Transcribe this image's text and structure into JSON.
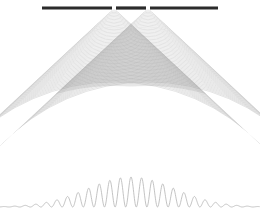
{
  "figure": {
    "background_color": "#ffffff",
    "width": 260,
    "height": 212
  },
  "barrier": {
    "name": "slit-barrier",
    "color": "#2b2b2b",
    "x_start": 42,
    "x_end": 218,
    "y": 8,
    "thickness": 3.2
  },
  "slits": [
    {
      "label": "slit-1",
      "x": 114.0,
      "y": 8,
      "width": 4.0
    },
    {
      "label": "slit-2",
      "x": 148.0,
      "y": 8,
      "width": 4.0
    }
  ],
  "wavefronts": {
    "name": "circular-wavefronts",
    "color": "#9a9a9a",
    "stroke_width": 0.5,
    "wavelength": 3.9,
    "ring_count": 52,
    "half_angle_deg": 47,
    "max_radius": 214,
    "opacity": 0.55
  },
  "overlap_region": {
    "name": "interference-overlap",
    "shading_color": "#bdbdbd",
    "opacity": 0.35
  },
  "intensity_curve": {
    "name": "interference-intensity-curve",
    "color": "#b4b4b4",
    "stroke_width": 0.8,
    "baseline_y": 207,
    "peak_height": 30,
    "center_x": 131,
    "fringe_count": 11,
    "fringe_spacing": 10.6,
    "envelope_width": 62
  },
  "chart_data": {
    "type": "line",
    "xlabel": "",
    "ylabel": "",
    "x": [
      -5,
      -4.5,
      -4,
      -3.5,
      -3,
      -2.5,
      -2,
      -1.5,
      -1,
      -0.5,
      0,
      0.5,
      1,
      1.5,
      2,
      2.5,
      3,
      3.5,
      4,
      4.5,
      5
    ],
    "values": [
      0.04,
      0.0,
      0.11,
      0.0,
      0.22,
      0.0,
      0.41,
      0.0,
      0.71,
      0.0,
      1.0,
      0.0,
      0.71,
      0.0,
      0.41,
      0.0,
      0.22,
      0.0,
      0.11,
      0.0,
      0.04
    ],
    "series": [
      {
        "name": "Intensity I(theta)",
        "values": [
          0.04,
          0.0,
          0.11,
          0.0,
          0.22,
          0.0,
          0.41,
          0.0,
          0.71,
          0.0,
          1.0,
          0.0,
          0.71,
          0.0,
          0.41,
          0.0,
          0.22,
          0.0,
          0.11,
          0.0,
          0.04
        ]
      }
    ],
    "ylim": [
      0,
      1.05
    ],
    "xlim": [
      -5,
      5
    ],
    "grid": false,
    "legend": "none"
  }
}
